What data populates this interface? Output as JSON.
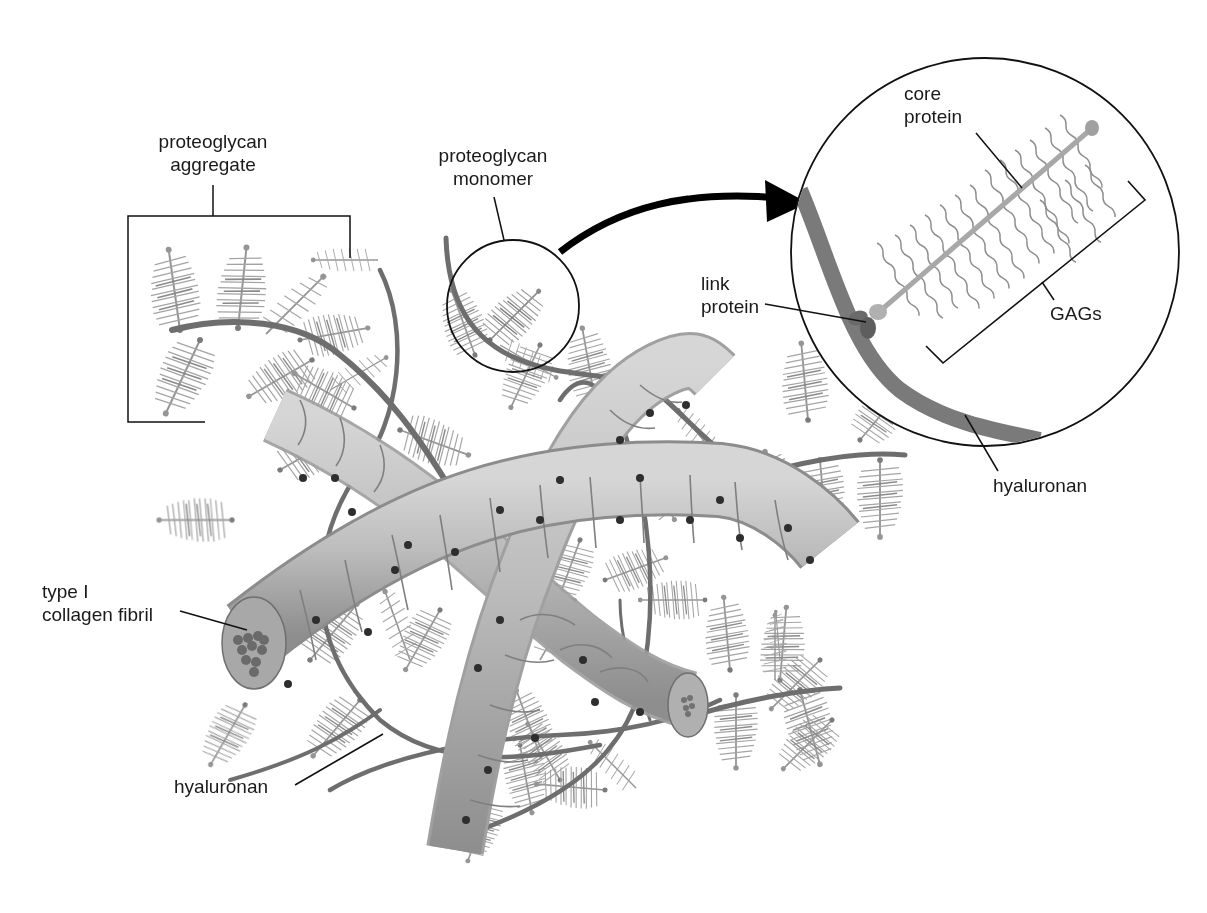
{
  "figure": {
    "colors": {
      "background": "#ffffff",
      "label_text": "#1a1a1a",
      "leader_line": "#111111",
      "hyaluronan": "#6e6e6e",
      "collagen_fill": "#b9b9b9",
      "collagen_band": "#8a8a8a",
      "collagen_dot": "#2e2e2e",
      "gag_bristle": "#8f8f8f",
      "core_protein": "#a8a8a8",
      "link_protein": "#6a6a6a",
      "arrow": "#000000"
    }
  },
  "labels": {
    "proteoglycan_aggregate": {
      "line1": "proteoglycan",
      "line2": "aggregate"
    },
    "proteoglycan_monomer": {
      "line1": "proteoglycan",
      "line2": "monomer"
    },
    "core_protein": {
      "line1": "core",
      "line2": "protein"
    },
    "link_protein": {
      "line1": "link",
      "line2": "protein"
    },
    "gags": {
      "text": "GAGs"
    },
    "hyaluronan_inset": {
      "text": "hyaluronan"
    },
    "collagen_fibril": {
      "line1": "type I",
      "line2": "collagen fibril"
    },
    "hyaluronan_main": {
      "text": "hyaluronan"
    }
  }
}
